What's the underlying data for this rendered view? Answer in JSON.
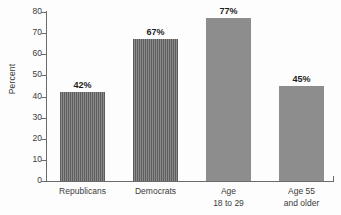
{
  "chart_data": {
    "type": "bar",
    "title": "",
    "subtitle": "",
    "xlabel": "",
    "ylabel": "Percent",
    "ylim": [
      0,
      80
    ],
    "ytick_step": 10,
    "yticks": [
      "80",
      "70",
      "60",
      "50",
      "40",
      "30",
      "20",
      "10",
      "0"
    ],
    "grid": false,
    "legend": null,
    "categories": [
      {
        "line1": "Republicans",
        "line2": ""
      },
      {
        "line1": "Democrats",
        "line2": ""
      },
      {
        "line1": "Age",
        "line2": "18 to 29"
      },
      {
        "line1": "Age 55",
        "line2": "and older"
      }
    ],
    "values": [
      42,
      67,
      77,
      45
    ],
    "data_labels": [
      "42%",
      "67%",
      "77%",
      "45%"
    ],
    "bar_styles": [
      "striped",
      "striped",
      "solid",
      "solid"
    ],
    "colors": {
      "bar_striped_dark": "#5d5d5d",
      "bar_striped_light": "#8b8b8b",
      "bar_solid": "#8d8d8d",
      "axis": "#6b6b6b",
      "text": "#3b3b3b",
      "label_text": "#1d1d1d",
      "background": "#fdfdfd"
    }
  }
}
